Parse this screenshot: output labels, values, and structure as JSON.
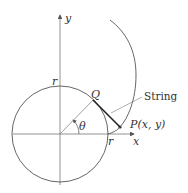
{
  "diagram": {
    "axes": {
      "x_label": "x",
      "y_label": "y"
    },
    "labels": {
      "r_top": "r",
      "r_right": "r",
      "q": "Q",
      "theta": "θ",
      "p": "P(x, y)",
      "string": "String"
    },
    "colors": {
      "stroke": "#555555",
      "string": "#222222",
      "text": "#333333"
    }
  }
}
